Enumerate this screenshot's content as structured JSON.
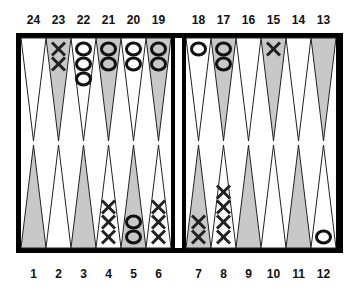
{
  "colors": {
    "dark_point": "#c8c8c8",
    "light_point": "#ffffff",
    "frame": "#000000",
    "checker_stroke": "#111111"
  },
  "top_labels": [
    "24",
    "23",
    "22",
    "21",
    "20",
    "19",
    "18",
    "17",
    "16",
    "15",
    "14",
    "13"
  ],
  "bottom_labels": [
    "1",
    "2",
    "3",
    "4",
    "5",
    "6",
    "7",
    "8",
    "9",
    "10",
    "11",
    "12"
  ],
  "checkers": {
    "23": {
      "player": "X",
      "count": 2
    },
    "22": {
      "player": "O",
      "count": 3
    },
    "21": {
      "player": "O",
      "count": 2
    },
    "20": {
      "player": "O",
      "count": 2
    },
    "19": {
      "player": "O",
      "count": 2
    },
    "18": {
      "player": "O",
      "count": 1
    },
    "17": {
      "player": "O",
      "count": 2
    },
    "15": {
      "player": "X",
      "count": 1
    },
    "4": {
      "player": "X",
      "count": 3
    },
    "5": {
      "player": "O",
      "count": 2
    },
    "6": {
      "player": "X",
      "count": 3
    },
    "7": {
      "player": "X",
      "count": 2
    },
    "8": {
      "player": "X",
      "count": 4
    },
    "12": {
      "player": "O",
      "count": 1
    }
  }
}
